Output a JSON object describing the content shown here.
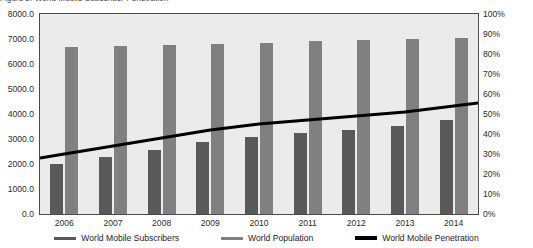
{
  "title_clipped": "Figure 2: World Mobile Subscriber Penetration",
  "colors": {
    "subscribers": "#595959",
    "population": "#808080",
    "penetration": "#000000",
    "plot_background": "#ebebeb",
    "plot_border": "#4a4a4a",
    "text": "#2b2b2b"
  },
  "axes": {
    "left_ticks": [
      "8000.0",
      "7000.0",
      "6000.0",
      "5000.0",
      "4000.0",
      "3000.0",
      "2000.0",
      "1000.0",
      "0.0"
    ],
    "right_ticks": [
      "100%",
      "90%",
      "80%",
      "70%",
      "60%",
      "50%",
      "40%",
      "30%",
      "20%",
      "10%",
      "0%"
    ]
  },
  "legend": {
    "items": [
      {
        "label": "World Mobile Subscribers",
        "color": "#595959",
        "kind": "bar"
      },
      {
        "label": "World Population",
        "color": "#808080",
        "kind": "bar"
      },
      {
        "label": "World Mobile Penetration",
        "color": "#000000",
        "kind": "line"
      }
    ]
  },
  "chart_data": {
    "type": "bar",
    "title": "World Mobile Subscriber Penetration",
    "xlabel": "",
    "ylabel": "",
    "ylabel_right": "",
    "categories": [
      "2006",
      "2007",
      "2008",
      "2009",
      "2010",
      "2011",
      "2012",
      "2013",
      "2014"
    ],
    "ylim": [
      0,
      8000
    ],
    "ylim_right": [
      0,
      100
    ],
    "ytick_step": 1000,
    "ytick_step_right": 10,
    "grid": false,
    "legend_position": "bottom",
    "series": [
      {
        "name": "World Mobile Subscribers",
        "type": "bar",
        "axis": "left",
        "color": "#595959",
        "values": [
          2020,
          2270,
          2560,
          2870,
          3090,
          3230,
          3380,
          3530,
          3760
        ]
      },
      {
        "name": "World Population",
        "type": "bar",
        "axis": "left",
        "color": "#808080",
        "values": [
          6690,
          6720,
          6760,
          6790,
          6830,
          6930,
          6960,
          7000,
          7050
        ]
      },
      {
        "name": "World Mobile Penetration",
        "type": "line",
        "axis": "right",
        "color": "#000000",
        "values": [
          30,
          34,
          38,
          42,
          45,
          47,
          49,
          51,
          54
        ]
      }
    ]
  }
}
